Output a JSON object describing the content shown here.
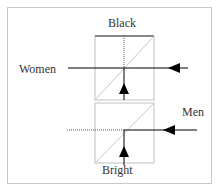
{
  "diagram": {
    "labels": {
      "top": "Black",
      "left": "Women",
      "right": "Men",
      "bottom": "Bright"
    },
    "colors": {
      "line": "#000000",
      "box": "#c0c0c0",
      "frame": "#c8c8c8"
    }
  }
}
